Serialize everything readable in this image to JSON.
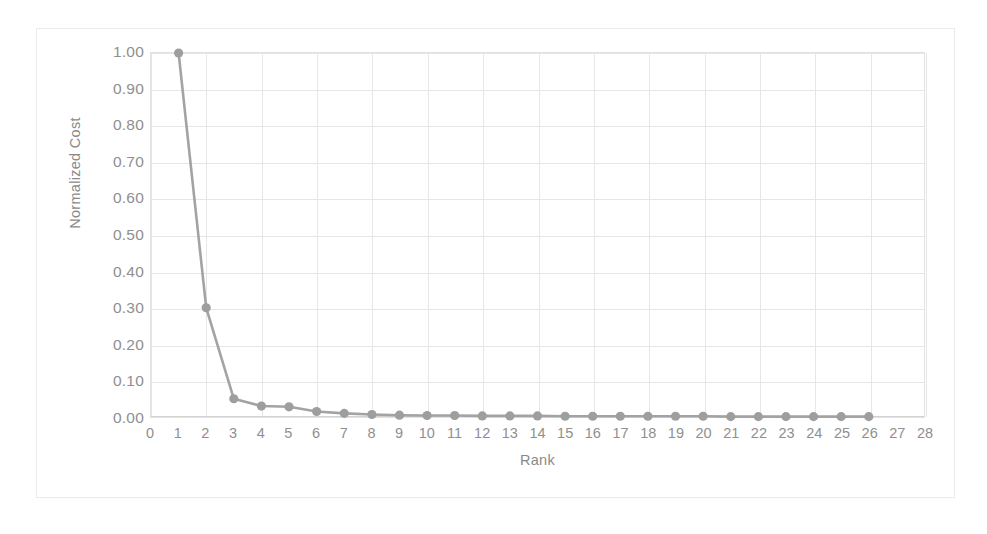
{
  "chart_data": {
    "type": "line",
    "title": "",
    "xlabel": "Rank",
    "ylabel": "Normalized Cost",
    "xlim": [
      0,
      28
    ],
    "ylim": [
      0.0,
      1.0
    ],
    "grid": true,
    "legend": false,
    "x_ticks": [
      0,
      1,
      2,
      3,
      4,
      5,
      6,
      7,
      8,
      9,
      10,
      11,
      12,
      13,
      14,
      15,
      16,
      17,
      18,
      19,
      20,
      21,
      22,
      23,
      24,
      25,
      26,
      27,
      28
    ],
    "x_tick_labels": [
      "0",
      "1",
      "2",
      "3",
      "4",
      "5",
      "6",
      "7",
      "8",
      "9",
      "10",
      "11",
      "12",
      "13",
      "14",
      "15",
      "16",
      "17",
      "18",
      "19",
      "20",
      "21",
      "22",
      "23",
      "24",
      "25",
      "26",
      "27",
      "28"
    ],
    "y_ticks": [
      0.0,
      0.1,
      0.2,
      0.3,
      0.4,
      0.5,
      0.6,
      0.7,
      0.8,
      0.9,
      1.0
    ],
    "y_tick_labels": [
      "0.00",
      "0.10",
      "0.20",
      "0.30",
      "0.40",
      "0.50",
      "0.60",
      "0.70",
      "0.80",
      "0.90",
      "1.00"
    ],
    "series": [
      {
        "name": "Normalized Cost",
        "color": "#a3a3a3",
        "marker": "circle",
        "x": [
          1,
          2,
          3,
          4,
          5,
          6,
          7,
          8,
          9,
          10,
          11,
          12,
          13,
          14,
          15,
          16,
          17,
          18,
          19,
          20,
          21,
          22,
          23,
          24,
          25,
          26
        ],
        "values": [
          1.0,
          0.3,
          0.05,
          0.03,
          0.028,
          0.015,
          0.01,
          0.007,
          0.005,
          0.004,
          0.004,
          0.003,
          0.003,
          0.003,
          0.002,
          0.002,
          0.002,
          0.002,
          0.002,
          0.002,
          0.001,
          0.001,
          0.001,
          0.001,
          0.001,
          0.001
        ]
      }
    ]
  },
  "style": {
    "line_color": "#a3a3a3",
    "marker_color": "#9e9e9e",
    "grid_color": "#e6e6e6",
    "axis_color": "#d2d2d2",
    "frame_color": "#ebebeb",
    "tick_text_color": "#8f8f8f",
    "axis_title_color": "#8a8a8a",
    "background": "#ffffff"
  }
}
